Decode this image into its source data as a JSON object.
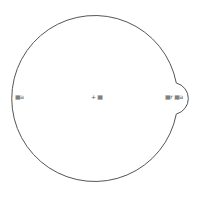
{
  "diagram": {
    "type": "circle-with-bump",
    "stroke_color": "#555555",
    "background": "#ffffff",
    "main_circle": {
      "cx": 95,
      "cy": 96,
      "r": 83
    },
    "bump": {
      "start_y": 83,
      "end_y": 114,
      "max_x": 192
    },
    "labels": {
      "left": "▦a",
      "center": "+ ▦",
      "right": "▦r ▦a"
    }
  }
}
